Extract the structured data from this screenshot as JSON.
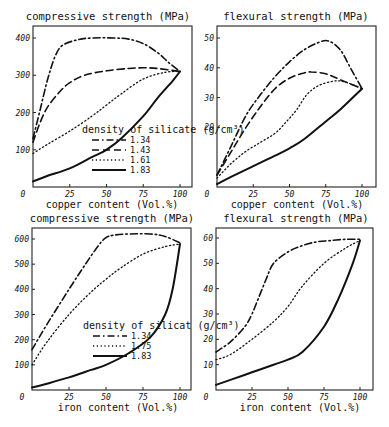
{
  "figure": {
    "panels": [
      {
        "id": "p1",
        "title": "compressive strength (MPa)",
        "xlabel": "copper content (Vol.%)",
        "frame": {
          "left": 33,
          "right": 192,
          "top": 26,
          "bottom": 187
        },
        "xmap": {
          "x0": 33,
          "x1": 180,
          "v0": 0,
          "v1": 100
        },
        "ymap": {
          "y0": 187,
          "y1": 38,
          "v0": 0,
          "v1": 400
        },
        "xticks": [
          0,
          25,
          50,
          75,
          100
        ],
        "xtick_labels": [
          "0",
          "25",
          "50",
          "75",
          "100"
        ],
        "yticks": [
          100,
          200,
          300,
          400
        ],
        "ytick_labels": [
          "100",
          "200",
          "300",
          "400"
        ],
        "legend": {
          "title": "density of silicate (g/cm³)",
          "x": 82,
          "y": 133,
          "entries": [
            "1.34",
            "1.43",
            "1.61",
            "1.83"
          ]
        }
      },
      {
        "id": "p2",
        "title": "flexural strength (MPa)",
        "xlabel": "copper content (Vol.%)",
        "frame": {
          "left": 217,
          "right": 376,
          "top": 26,
          "bottom": 187
        },
        "xmap": {
          "x0": 217,
          "x1": 362,
          "v0": 0,
          "v1": 100
        },
        "ymap": {
          "y0": 187,
          "y1": 38,
          "v0": 0,
          "v1": 50
        },
        "xticks": [
          0,
          25,
          50,
          75,
          100
        ],
        "xtick_labels": [
          "0",
          "25",
          "50",
          "75",
          "100"
        ],
        "yticks": [
          20,
          30,
          40,
          50
        ],
        "ytick_labels": [
          "20",
          "30",
          "40",
          "50"
        ],
        "legend": null
      },
      {
        "id": "p3",
        "title": "compressive strength (MPa)",
        "xlabel": "iron content (Vol.%)",
        "frame": {
          "left": 32,
          "right": 191,
          "top": 228,
          "bottom": 390
        },
        "xmap": {
          "x0": 32,
          "x1": 180,
          "v0": 0,
          "v1": 100
        },
        "ymap": {
          "y0": 390,
          "y1": 239,
          "v0": 0,
          "v1": 600
        },
        "xticks": [
          0,
          25,
          50,
          75,
          100
        ],
        "xtick_labels": [
          "0",
          "25",
          "50",
          "75",
          "100"
        ],
        "yticks": [
          100,
          200,
          300,
          400,
          500,
          600
        ],
        "ytick_labels": [
          "100",
          "200",
          "300",
          "400",
          "500",
          "600"
        ],
        "legend": {
          "title": "density of silicat (g/cm³)",
          "x": 83,
          "y": 329,
          "entries": [
            "1.34",
            "1.75",
            "1.83"
          ]
        }
      },
      {
        "id": "p4",
        "title": "flexural strength (MPa)",
        "xlabel": "iron content (Vol.%)",
        "frame": {
          "left": 216,
          "right": 373,
          "top": 228,
          "bottom": 390
        },
        "xmap": {
          "x0": 216,
          "x1": 360,
          "v0": 0,
          "v1": 100
        },
        "ymap": {
          "y0": 390,
          "y1": 238,
          "v0": 0,
          "v1": 60
        },
        "xticks": [
          0,
          25,
          50,
          75,
          100
        ],
        "xtick_labels": [
          "0",
          "25",
          "50",
          "75",
          "100"
        ],
        "yticks": [
          10,
          20,
          30,
          40,
          50,
          60
        ],
        "ytick_labels": [
          "10",
          "20",
          "30",
          "40",
          "50",
          "60"
        ],
        "legend": null
      }
    ],
    "line_styles": {
      "1.34": {
        "dash": "7 3 1.5 3",
        "width": 1.6
      },
      "1.43": {
        "dash": "7 4",
        "width": 1.6
      },
      "1.61": {
        "dash": "1.2 2.6",
        "width": 1.3
      },
      "1.75": {
        "dash": "1.2 2.6",
        "width": 1.3
      },
      "1.83": {
        "dash": "",
        "width": 2.0
      }
    },
    "origin_label": "0"
  },
  "chart_data": [
    {
      "type": "line",
      "title": "compressive strength (MPa)",
      "xlabel": "copper content (Vol.%)",
      "ylabel": "compressive strength (MPa)",
      "xlim": [
        0,
        100
      ],
      "ylim": [
        0,
        420
      ],
      "grid": false,
      "legend_title": "density of silicate (g/cm³)",
      "legend_position": "lower right (inside)",
      "series": [
        {
          "name": "1.34",
          "x": [
            0,
            5,
            10,
            15,
            20,
            30,
            40,
            55,
            65,
            75,
            85,
            92,
            100
          ],
          "values": [
            130,
            210,
            290,
            350,
            380,
            395,
            400,
            400,
            397,
            385,
            360,
            335,
            310
          ]
        },
        {
          "name": "1.43",
          "x": [
            0,
            5,
            10,
            18,
            25,
            35,
            50,
            65,
            75,
            85,
            100
          ],
          "values": [
            120,
            175,
            215,
            255,
            280,
            300,
            312,
            318,
            320,
            318,
            310
          ]
        },
        {
          "name": "1.61",
          "x": [
            0,
            10,
            25,
            40,
            50,
            60,
            75,
            90,
            100
          ],
          "values": [
            90,
            115,
            150,
            190,
            220,
            250,
            290,
            308,
            310
          ]
        },
        {
          "name": "1.83",
          "x": [
            0,
            10,
            25,
            40,
            50,
            60,
            75,
            85,
            95,
            100
          ],
          "values": [
            15,
            30,
            50,
            80,
            100,
            130,
            190,
            240,
            285,
            310
          ]
        }
      ]
    },
    {
      "type": "line",
      "title": "flexural strength (MPa)",
      "xlabel": "copper content (Vol.%)",
      "ylabel": "flexural strength (MPa)",
      "xlim": [
        0,
        100
      ],
      "ylim": [
        0,
        53
      ],
      "grid": false,
      "series": [
        {
          "name": "1.34",
          "x": [
            0,
            10,
            20,
            30,
            40,
            50,
            60,
            70,
            77,
            85,
            92,
            100
          ],
          "values": [
            4,
            14,
            24,
            31,
            37,
            42,
            46,
            48.5,
            49,
            46,
            40,
            33
          ]
        },
        {
          "name": "1.43",
          "x": [
            0,
            10,
            20,
            30,
            40,
            50,
            60,
            65,
            75,
            85,
            100
          ],
          "values": [
            4,
            12,
            20,
            27,
            33,
            36.5,
            38.3,
            38.6,
            38,
            36,
            33
          ]
        },
        {
          "name": "1.61",
          "x": [
            0,
            10,
            20,
            30,
            40,
            48,
            55,
            62,
            70,
            80,
            88,
            100
          ],
          "values": [
            3,
            8,
            12,
            15,
            18,
            22,
            26,
            31,
            34,
            35.5,
            35.3,
            33
          ]
        },
        {
          "name": "1.83",
          "x": [
            0,
            10,
            25,
            40,
            50,
            60,
            75,
            85,
            100
          ],
          "values": [
            1,
            3.5,
            7,
            10.5,
            13,
            16,
            22,
            26,
            33
          ]
        }
      ]
    },
    {
      "type": "line",
      "title": "compressive strength (MPa)",
      "xlabel": "iron content (Vol.%)",
      "ylabel": "compressive strength (MPa)",
      "xlim": [
        0,
        100
      ],
      "ylim": [
        0,
        640
      ],
      "grid": false,
      "legend_title": "density of silicat (g/cm³)",
      "legend_position": "lower right (inside)",
      "series": [
        {
          "name": "1.34",
          "x": [
            0,
            10,
            25,
            35,
            45,
            50,
            55,
            65,
            80,
            90,
            100
          ],
          "values": [
            160,
            260,
            400,
            490,
            575,
            605,
            615,
            620,
            620,
            610,
            585
          ]
        },
        {
          "name": "1.75",
          "x": [
            0,
            10,
            25,
            40,
            50,
            60,
            75,
            90,
            100
          ],
          "values": [
            100,
            190,
            300,
            390,
            440,
            485,
            540,
            570,
            580
          ]
        },
        {
          "name": "1.83",
          "x": [
            0,
            10,
            25,
            40,
            50,
            65,
            80,
            90,
            95,
            100
          ],
          "values": [
            10,
            25,
            50,
            80,
            100,
            145,
            210,
            300,
            400,
            580
          ]
        }
      ]
    },
    {
      "type": "line",
      "title": "flexural strength (MPa)",
      "xlabel": "iron content (Vol.%)",
      "ylabel": "flexural strength (MPa)",
      "xlim": [
        0,
        100
      ],
      "ylim": [
        0,
        64
      ],
      "grid": false,
      "series": [
        {
          "name": "1.34",
          "x": [
            0,
            10,
            20,
            25,
            30,
            35,
            40,
            50,
            60,
            70,
            80,
            90,
            100
          ],
          "values": [
            15,
            19,
            25,
            30,
            37,
            44,
            50,
            54.5,
            57,
            58.5,
            59,
            59.5,
            59.5
          ]
        },
        {
          "name": "1.75",
          "x": [
            0,
            10,
            25,
            40,
            50,
            60,
            75,
            90,
            100
          ],
          "values": [
            12,
            14,
            20,
            27,
            33,
            41,
            50,
            56,
            59
          ]
        },
        {
          "name": "1.83",
          "x": [
            0,
            10,
            25,
            40,
            50,
            60,
            75,
            85,
            95,
            100
          ],
          "values": [
            2,
            4,
            7,
            10,
            12,
            15,
            25,
            36,
            50,
            59
          ]
        }
      ]
    }
  ]
}
